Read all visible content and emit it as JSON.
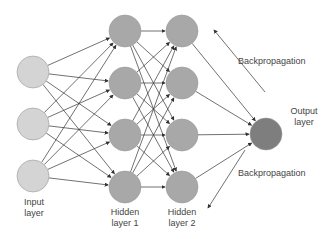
{
  "diagram": {
    "colors": {
      "input_node": "#d4d4d4",
      "hidden_node": "#a8a8a8",
      "output_node": "#7e7e7e",
      "edge": "#333333",
      "text": "#444444"
    },
    "layers": [
      {
        "id": "input",
        "label_line1": "Input",
        "label_line2": "layer",
        "x": 33,
        "nodes_y": [
          72,
          124,
          176
        ]
      },
      {
        "id": "hidden1",
        "label_line1": "Hidden",
        "label_line2": "layer 1",
        "x": 125,
        "nodes_y": [
          31,
          83,
          135,
          187
        ]
      },
      {
        "id": "hidden2",
        "label_line1": "Hidden",
        "label_line2": "layer 2",
        "x": 182,
        "nodes_y": [
          31,
          83,
          135,
          187
        ]
      },
      {
        "id": "output",
        "label_line1": "Output",
        "label_line2": "layer",
        "x": 266,
        "nodes_y": [
          134
        ]
      }
    ],
    "annotations": {
      "backprop_top": "Backpropagation",
      "backprop_bottom": "Backpropagation"
    }
  }
}
